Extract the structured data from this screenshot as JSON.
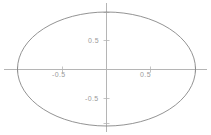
{
  "chart_data": {
    "type": "line",
    "title": "",
    "xlabel": "",
    "ylabel": "",
    "grid": false,
    "legend": null,
    "axes_style": "centered-cross-at-origin",
    "xlim": [
      -1.2,
      1.2
    ],
    "ylim": [
      -1.25,
      1.25
    ],
    "x_ticks": [
      -0.5,
      0.5
    ],
    "y_ticks": [
      -0.5,
      0.5
    ],
    "x_tick_labels": [
      "-0.5",
      "0.5"
    ],
    "y_tick_labels": [
      "-0.5",
      "0.5"
    ],
    "curves": [
      {
        "name": "ellipse",
        "equation": "x^2 + y^2 = 1 (unit circle, anisotropic aspect)",
        "closed": true,
        "center": [
          0,
          0
        ],
        "semi_axis_x": 1.0,
        "semi_axis_y": 1.0,
        "color": "#808080",
        "line_width": 0.8,
        "vertices": [
          [
            1.0,
            0.0
          ],
          [
            0.0,
            1.0
          ],
          [
            -1.0,
            0.0
          ],
          [
            0.0,
            -1.0
          ]
        ]
      }
    ]
  },
  "plot": {
    "axis_color": "#b5b5b5",
    "curve_color": "#7d7d7d",
    "tick_color": "#b5b5b5",
    "label_color": "#9a9a9a",
    "background": "#ffffff",
    "x_tick_neg_label": "-0.5",
    "x_tick_pos_label": "0.5",
    "y_tick_pos_label": "0.5",
    "y_tick_neg_label": "-0.5"
  }
}
